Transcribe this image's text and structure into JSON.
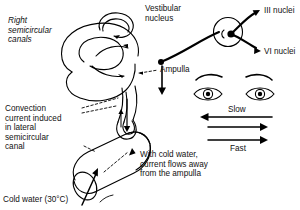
{
  "figure": {
    "title_visible": false,
    "type": "anatomical-diagram"
  },
  "labels": {
    "right_semicircular_canals": "Right\nsemicircular\ncanals",
    "vestibular_nucleus": "Vestibular\nnucleus",
    "iii_nuclei": "III nuclei",
    "vi_nuclei": "VI nuclei",
    "ampulla": "Ampulla",
    "convection_current": "Convection\ncurrent induced\nin lateral\nsemicircular\ncanal",
    "cold_water": "Cold water (30°C)",
    "with_cold_water": "With cold water,\ncurrent flows away\nfrom the ampulla",
    "slow": "Slow",
    "fast": "Fast"
  },
  "icons": {
    "eye_left": "eye-icon",
    "eye_right": "eye-icon",
    "eyebrow_left": "eyebrow-icon",
    "eyebrow_right": "eyebrow-icon",
    "canal_loop": "semicircular-canal-icon",
    "nucleus_circle": "vestibular-nucleus-icon",
    "cylinder": "lateral-canal-cylinder-icon",
    "arrow_slow": "arrow-left-icon",
    "arrow_fast_1": "arrow-right-icon",
    "arrow_fast_2": "arrow-right-icon",
    "arrow_cold_water": "arrow-pointer-icon",
    "arrow_flow_down": "arrow-down-icon"
  },
  "colors": {
    "ink": "#000000",
    "background": "#ffffff",
    "text": "#111111"
  }
}
